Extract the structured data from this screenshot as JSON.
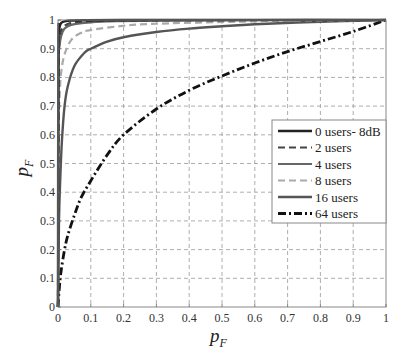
{
  "chart_data": {
    "type": "line",
    "title": "",
    "xlabel": "p_F",
    "ylabel": "p_F",
    "xlim": [
      0,
      1
    ],
    "ylim": [
      0,
      1
    ],
    "grid": true,
    "legend_position": "center-right",
    "x_ticks": [
      "0",
      "0.1",
      "0.2",
      "0.3",
      "0.4",
      "0.5",
      "0.6",
      "0.7",
      "0.8",
      "0.9",
      "1"
    ],
    "y_ticks": [
      "0",
      "0.1",
      "0.2",
      "0.3",
      "0.4",
      "0.5",
      "0.6",
      "0.7",
      "0.8",
      "0.9",
      "1"
    ],
    "series": [
      {
        "name": "0 users- 8dB",
        "style": "solid",
        "color": "#222222",
        "width": 2.4,
        "x": [
          0,
          0.001,
          0.003,
          0.006,
          0.01,
          0.02,
          0.04,
          0.08,
          0.2,
          0.5,
          1
        ],
        "y": [
          0,
          0.9,
          0.96,
          0.98,
          0.99,
          0.995,
          0.998,
          0.999,
          1,
          1,
          1
        ]
      },
      {
        "name": "2 users",
        "style": "dashed",
        "color": "#444444",
        "width": 2.2,
        "x": [
          0,
          0.002,
          0.005,
          0.01,
          0.02,
          0.04,
          0.08,
          0.15,
          0.3,
          0.6,
          1
        ],
        "y": [
          0,
          0.88,
          0.94,
          0.965,
          0.98,
          0.99,
          0.995,
          0.998,
          0.999,
          1,
          1
        ]
      },
      {
        "name": "4 users",
        "style": "solid",
        "color": "#666666",
        "width": 2.2,
        "x": [
          0,
          0.002,
          0.005,
          0.01,
          0.02,
          0.04,
          0.08,
          0.15,
          0.3,
          0.6,
          1
        ],
        "y": [
          0,
          0.82,
          0.91,
          0.945,
          0.97,
          0.983,
          0.99,
          0.995,
          0.998,
          1,
          1
        ]
      },
      {
        "name": "8 users",
        "style": "dashed",
        "color": "#aaaaaa",
        "width": 2.2,
        "x": [
          0,
          0.002,
          0.005,
          0.01,
          0.02,
          0.04,
          0.07,
          0.1,
          0.2,
          0.3,
          0.5,
          0.7,
          1
        ],
        "y": [
          0,
          0.6,
          0.74,
          0.82,
          0.88,
          0.93,
          0.955,
          0.965,
          0.98,
          0.987,
          0.993,
          0.997,
          1
        ]
      },
      {
        "name": "16 users",
        "style": "solid",
        "color": "#555555",
        "width": 2.4,
        "x": [
          0,
          0.003,
          0.007,
          0.012,
          0.02,
          0.03,
          0.05,
          0.08,
          0.1,
          0.15,
          0.2,
          0.3,
          0.4,
          0.5,
          0.6,
          0.8,
          1
        ],
        "y": [
          0,
          0.3,
          0.45,
          0.58,
          0.7,
          0.77,
          0.84,
          0.885,
          0.9,
          0.925,
          0.94,
          0.958,
          0.97,
          0.978,
          0.985,
          0.994,
          1
        ]
      },
      {
        "name": "64 users",
        "style": "dashdot",
        "color": "#111111",
        "width": 2.8,
        "x": [
          0,
          0.005,
          0.01,
          0.02,
          0.03,
          0.05,
          0.07,
          0.1,
          0.15,
          0.2,
          0.3,
          0.4,
          0.5,
          0.6,
          0.7,
          0.8,
          0.9,
          1
        ],
        "y": [
          0,
          0.08,
          0.13,
          0.2,
          0.25,
          0.32,
          0.38,
          0.44,
          0.53,
          0.6,
          0.69,
          0.755,
          0.805,
          0.85,
          0.89,
          0.925,
          0.96,
          1
        ]
      }
    ]
  }
}
